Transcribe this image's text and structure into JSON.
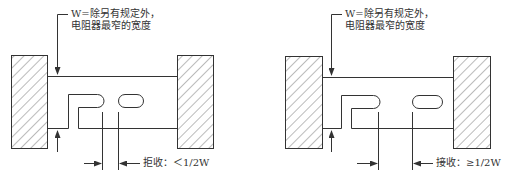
{
  "figures": [
    {
      "id": "reject",
      "note_line1": "W=除另有规定外，",
      "note_line2": "电阻器最窄的宽度",
      "criterion_label": "拒收：",
      "criterion_value": "＜1/2W"
    },
    {
      "id": "accept",
      "note_line1": "W=除另有规定外，",
      "note_line2": "电阻器最窄的宽度",
      "criterion_label": "接收：",
      "criterion_value": "≥1/2W"
    }
  ],
  "colors": {
    "line": "#333333",
    "hatch": "#555555",
    "background": "#ffffff"
  }
}
